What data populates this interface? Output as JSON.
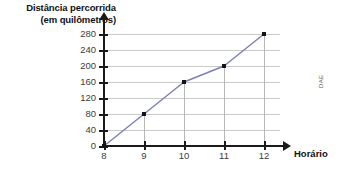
{
  "credit": "DAE",
  "title": {
    "line1": "Distância percorrida",
    "line2": "(em quilômetros)"
  },
  "axis": {
    "x_name": "Horário"
  },
  "chart_data": {
    "type": "line",
    "title": "Distância percorrida (em quilômetros)",
    "xlabel": "Horário",
    "ylabel": "Distância percorrida (em quilômetros)",
    "x": [
      8,
      9,
      10,
      11,
      12
    ],
    "values": [
      0,
      80,
      160,
      200,
      280
    ],
    "xticklabels": [
      "8",
      "9",
      "10",
      "11",
      "12"
    ],
    "yticklabels": [
      "0",
      "40",
      "80",
      "120",
      "160",
      "200",
      "240",
      "280"
    ],
    "yticks": [
      0,
      40,
      80,
      120,
      160,
      200,
      240,
      280
    ],
    "xlim": [
      8,
      12
    ],
    "ylim": [
      0,
      280
    ],
    "grid": "horizontal",
    "legend": "none",
    "line_color": "#7b7fb5",
    "marker_color": "#141414",
    "axis_color": "#1a1a1a",
    "gridline_color": "#c9c9c9"
  }
}
